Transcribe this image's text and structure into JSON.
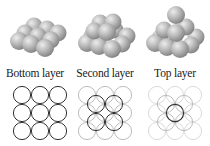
{
  "colors": {
    "sphere_fill": "#b4b4b4",
    "sphere_highlight": "#e6e6e6",
    "sphere_shadow": "#7a7a7a",
    "circle_active": "#333333",
    "circle_faded": "#bdbdbd",
    "circle_faded_2": "#d9d9d9",
    "label": "#1a1a1a"
  },
  "panels": [
    {
      "id": "bottom",
      "label": "Bottom layer",
      "pyramid_layers": 1,
      "grid": {
        "base_cells": "3x3",
        "active_layer": 1,
        "active_circles": 9
      }
    },
    {
      "id": "second",
      "label": "Second layer",
      "pyramid_layers": 2,
      "grid": {
        "base_cells": "3x3",
        "active_layer": 2,
        "active_circles": 4
      }
    },
    {
      "id": "top",
      "label": "Top layer",
      "pyramid_layers": 3,
      "grid": {
        "base_cells": "3x3",
        "active_layer": 3,
        "active_circles": 1
      }
    }
  ]
}
